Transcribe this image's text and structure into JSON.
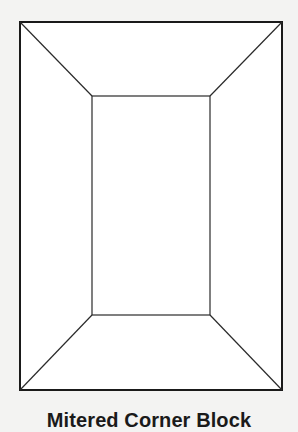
{
  "diagram": {
    "title": "Mitered Corner Block",
    "background_color": "#f3f3f2",
    "fill_color": "#ffffff",
    "stroke_color": "#1a1a1a",
    "outer_rect": {
      "x1": 20,
      "y1": 22,
      "x2": 282,
      "y2": 390
    },
    "inner_rect": {
      "x1": 92,
      "y1": 96,
      "x2": 210,
      "y2": 315
    }
  }
}
